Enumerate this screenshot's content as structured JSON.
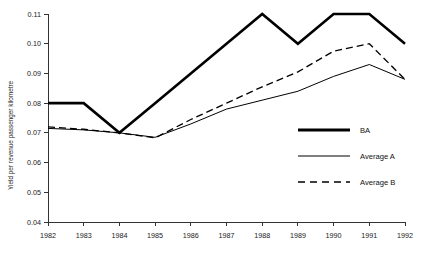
{
  "chart_data": {
    "type": "line",
    "title": "",
    "xlabel": "",
    "ylabel": "Yield per revenue passenger kilometre",
    "categories": [
      "1982",
      "1983",
      "1984",
      "1985",
      "1986",
      "1987",
      "1988",
      "1989",
      "1990",
      "1991",
      "1992"
    ],
    "x": [
      1982,
      1983,
      1984,
      1985,
      1986,
      1987,
      1988,
      1989,
      1990,
      1991,
      1992
    ],
    "xlim": [
      1982,
      1992
    ],
    "ylim": [
      0.04,
      0.11
    ],
    "yticks": [
      0.04,
      0.05,
      0.06,
      0.07,
      0.08,
      0.09,
      0.1,
      0.11
    ],
    "ytick_labels": [
      "0.04",
      "0.05",
      "0.06",
      "0.07",
      "0.08",
      "0.09",
      "0.10",
      "0.11"
    ],
    "xtick_labels": [
      "1982",
      "1983",
      "1984",
      "1985",
      "1986",
      "1987",
      "1988",
      "1989",
      "1990",
      "1991",
      "1992"
    ],
    "grid": false,
    "legend_position": "center-right",
    "series": [
      {
        "name": "BA",
        "style": "thick-solid",
        "color": "#000000",
        "values": [
          0.08,
          0.08,
          0.07,
          0.08,
          0.09,
          0.1,
          0.11,
          0.1,
          0.11,
          0.11,
          0.1
        ]
      },
      {
        "name": "Average A",
        "style": "thin-solid",
        "color": "#000000",
        "values": [
          0.0715,
          0.071,
          0.07,
          0.0685,
          0.073,
          0.078,
          0.081,
          0.084,
          0.089,
          0.093,
          0.088
        ]
      },
      {
        "name": "Average B",
        "style": "dashed",
        "color": "#000000",
        "values": [
          0.072,
          0.0712,
          0.07,
          0.0683,
          0.0745,
          0.08,
          0.0855,
          0.0905,
          0.0975,
          0.1,
          0.088
        ]
      }
    ]
  },
  "legend": {
    "items": [
      {
        "label": "BA"
      },
      {
        "label": "Average A"
      },
      {
        "label": "Average B"
      }
    ]
  },
  "axes": {
    "y_axis_title": "Yield per revenue passenger kilometre"
  }
}
